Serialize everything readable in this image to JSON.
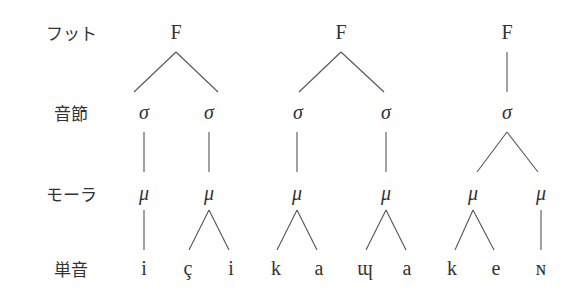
{
  "row_labels": {
    "foot": "フット",
    "syllable": "音節",
    "mora": "モーラ",
    "segment": "単音"
  },
  "symbols": {
    "foot": "F",
    "syllable": "σ",
    "mora": "μ"
  },
  "feet": [
    {
      "syllables": [
        {
          "moras": [
            {
              "segments": [
                "i"
              ]
            }
          ]
        },
        {
          "moras": [
            {
              "segments": [
                "ç",
                "i"
              ]
            }
          ]
        }
      ]
    },
    {
      "syllables": [
        {
          "moras": [
            {
              "segments": [
                "k",
                "a"
              ]
            }
          ]
        },
        {
          "moras": [
            {
              "segments": [
                "ɰ",
                "a"
              ]
            }
          ]
        }
      ]
    },
    {
      "syllables": [
        {
          "moras": [
            {
              "segments": [
                "k",
                "e"
              ]
            },
            {
              "segments": [
                "ɴ"
              ]
            }
          ]
        }
      ]
    }
  ],
  "segments_flat": [
    "i",
    "ç",
    "i",
    "k",
    "a",
    "ɰ",
    "a",
    "k",
    "e",
    "ɴ"
  ]
}
